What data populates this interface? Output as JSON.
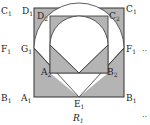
{
  "figure": {
    "caption": "R",
    "caption_sub": "1",
    "ellipsis": "··",
    "colors": {
      "shade": "#b4b4b4",
      "stroke": "#333333",
      "fill": "#ffffff"
    }
  },
  "labels": {
    "C1": {
      "main": "C",
      "sub": "1"
    },
    "D1": {
      "main": "D",
      "sub": "1"
    },
    "D2": {
      "main": "D",
      "sub": "2"
    },
    "C2": {
      "main": "C",
      "sub": "2"
    },
    "C1r": {
      "main": "C",
      "sub": "1"
    },
    "F1l": {
      "main": "F",
      "sub": "1"
    },
    "G1": {
      "main": "G",
      "sub": "1"
    },
    "F1r": {
      "main": "F",
      "sub": "1"
    },
    "A2": {
      "main": "A",
      "sub": "2"
    },
    "B2": {
      "main": "B",
      "sub": "2"
    },
    "B1l": {
      "main": "B",
      "sub": "1"
    },
    "A1": {
      "main": "A",
      "sub": "1"
    },
    "E1": {
      "main": "E",
      "sub": "1"
    },
    "B1r": {
      "main": "B",
      "sub": "1"
    }
  }
}
